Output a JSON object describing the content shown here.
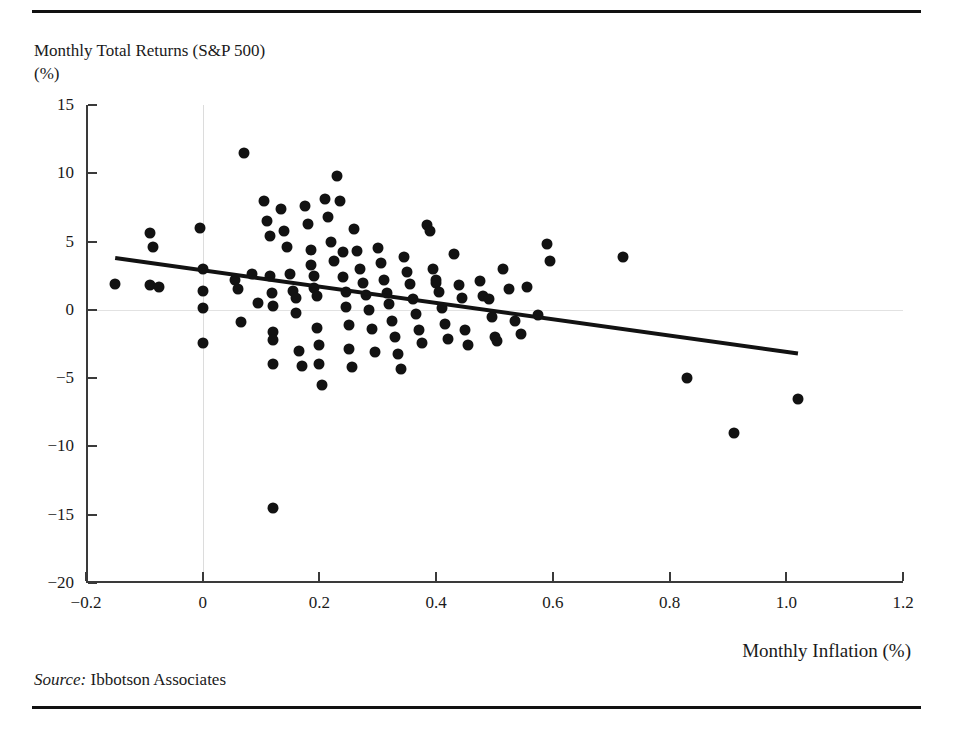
{
  "figure": {
    "y_axis_title_line1": "Monthly Total Returns (S&P 500)",
    "y_axis_title_line2": "(%)",
    "x_axis_title": "Monthly Inflation (%)",
    "source_prefix": "Source:",
    "source_text": " Ibbotson Associates",
    "accent_color": "#121212",
    "gridline_color": "#dcdcdc",
    "axis_color": "#3a3a3a"
  },
  "chart_data": {
    "type": "scatter",
    "title": "",
    "xlabel": "Monthly Inflation (%)",
    "ylabel": "Monthly Total Returns (S&P 500) (%)",
    "xlim": [
      -0.2,
      1.2
    ],
    "ylim": [
      -20,
      15
    ],
    "xticks": [
      "-0.2",
      "0",
      "0.2",
      "0.4",
      "0.6",
      "0.8",
      "1.0",
      "1.2"
    ],
    "xtick_values": [
      -0.2,
      0,
      0.2,
      0.4,
      0.6,
      0.8,
      1.0,
      1.2
    ],
    "yticks": [
      "15",
      "10",
      "5",
      "0",
      "-5",
      "-10",
      "-15",
      "-20"
    ],
    "ytick_values": [
      15,
      10,
      5,
      0,
      -5,
      -10,
      -15,
      -20
    ],
    "grid": "reference lines at x=0 and y=0 only",
    "legend": "none",
    "marker": "filled black circle",
    "trendline": {
      "type": "linear-fit",
      "x_start": -0.15,
      "y_start": 3.8,
      "x_end": 1.02,
      "y_end": -3.2,
      "slope": -5.98,
      "intercept": 2.9,
      "color": "#121212"
    },
    "points": [
      [
        -0.15,
        1.9
      ],
      [
        -0.09,
        5.6
      ],
      [
        -0.085,
        4.6
      ],
      [
        -0.09,
        1.8
      ],
      [
        -0.075,
        1.7
      ],
      [
        -0.005,
        6.0
      ],
      [
        0.0,
        3.0
      ],
      [
        0.0,
        1.4
      ],
      [
        0.0,
        0.1
      ],
      [
        0.0,
        -2.4
      ],
      [
        0.055,
        2.2
      ],
      [
        0.06,
        1.5
      ],
      [
        0.065,
        -0.9
      ],
      [
        0.07,
        11.5
      ],
      [
        0.085,
        2.6
      ],
      [
        0.095,
        0.5
      ],
      [
        0.105,
        8.0
      ],
      [
        0.11,
        6.5
      ],
      [
        0.115,
        5.4
      ],
      [
        0.115,
        2.5
      ],
      [
        0.118,
        1.2
      ],
      [
        0.12,
        0.3
      ],
      [
        0.12,
        -1.6
      ],
      [
        0.12,
        -2.2
      ],
      [
        0.12,
        -4.0
      ],
      [
        0.12,
        -14.5
      ],
      [
        0.135,
        7.4
      ],
      [
        0.14,
        5.8
      ],
      [
        0.145,
        4.6
      ],
      [
        0.15,
        2.6
      ],
      [
        0.155,
        1.4
      ],
      [
        0.16,
        0.9
      ],
      [
        0.16,
        -0.2
      ],
      [
        0.165,
        -3.0
      ],
      [
        0.17,
        -4.1
      ],
      [
        0.175,
        7.6
      ],
      [
        0.18,
        6.3
      ],
      [
        0.185,
        4.4
      ],
      [
        0.185,
        3.3
      ],
      [
        0.19,
        2.5
      ],
      [
        0.19,
        1.6
      ],
      [
        0.195,
        1.0
      ],
      [
        0.195,
        -1.3
      ],
      [
        0.2,
        -2.6
      ],
      [
        0.2,
        -4.0
      ],
      [
        0.205,
        -5.5
      ],
      [
        0.21,
        8.1
      ],
      [
        0.215,
        6.8
      ],
      [
        0.22,
        5.0
      ],
      [
        0.225,
        3.6
      ],
      [
        0.23,
        9.8
      ],
      [
        0.235,
        8.0
      ],
      [
        0.24,
        4.2
      ],
      [
        0.24,
        2.4
      ],
      [
        0.245,
        1.3
      ],
      [
        0.245,
        0.2
      ],
      [
        0.25,
        -1.1
      ],
      [
        0.25,
        -2.9
      ],
      [
        0.255,
        -4.2
      ],
      [
        0.26,
        5.9
      ],
      [
        0.265,
        4.3
      ],
      [
        0.27,
        3.0
      ],
      [
        0.275,
        2.0
      ],
      [
        0.28,
        1.1
      ],
      [
        0.285,
        0.0
      ],
      [
        0.29,
        -1.4
      ],
      [
        0.295,
        -3.1
      ],
      [
        0.3,
        4.5
      ],
      [
        0.305,
        3.4
      ],
      [
        0.31,
        2.2
      ],
      [
        0.315,
        1.2
      ],
      [
        0.32,
        0.4
      ],
      [
        0.325,
        -0.8
      ],
      [
        0.33,
        -2.0
      ],
      [
        0.335,
        -3.2
      ],
      [
        0.34,
        -4.3
      ],
      [
        0.345,
        3.9
      ],
      [
        0.35,
        2.8
      ],
      [
        0.355,
        1.9
      ],
      [
        0.36,
        0.8
      ],
      [
        0.365,
        -0.3
      ],
      [
        0.37,
        -1.5
      ],
      [
        0.375,
        -2.4
      ],
      [
        0.385,
        6.2
      ],
      [
        0.39,
        5.8
      ],
      [
        0.395,
        3.0
      ],
      [
        0.4,
        2.2
      ],
      [
        0.4,
        2.0
      ],
      [
        0.405,
        1.3
      ],
      [
        0.41,
        0.1
      ],
      [
        0.415,
        -1.0
      ],
      [
        0.42,
        -2.1
      ],
      [
        0.43,
        4.1
      ],
      [
        0.44,
        1.8
      ],
      [
        0.445,
        0.9
      ],
      [
        0.45,
        -1.5
      ],
      [
        0.455,
        -2.6
      ],
      [
        0.475,
        2.1
      ],
      [
        0.48,
        1.0
      ],
      [
        0.49,
        0.8
      ],
      [
        0.495,
        -0.5
      ],
      [
        0.5,
        -2.0
      ],
      [
        0.505,
        -2.3
      ],
      [
        0.515,
        3.0
      ],
      [
        0.525,
        1.5
      ],
      [
        0.535,
        -0.8
      ],
      [
        0.545,
        -1.8
      ],
      [
        0.555,
        1.7
      ],
      [
        0.575,
        -0.4
      ],
      [
        0.59,
        4.8
      ],
      [
        0.595,
        3.6
      ],
      [
        0.72,
        3.9
      ],
      [
        0.83,
        -5.0
      ],
      [
        0.91,
        -9.0
      ],
      [
        1.02,
        -6.5
      ]
    ]
  }
}
